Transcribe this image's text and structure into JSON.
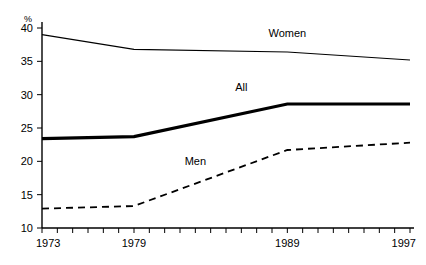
{
  "chart_data": {
    "type": "line",
    "title": "",
    "xlabel": "",
    "ylabel": "%",
    "x": [
      1973,
      1979,
      1989,
      1997
    ],
    "xlim": [
      1973,
      1997
    ],
    "ylim": [
      10,
      40
    ],
    "yticks": [
      10,
      15,
      20,
      25,
      30,
      35,
      40
    ],
    "xticks_labeled": [
      1973,
      1979,
      1989,
      1997
    ],
    "xticks_minor_step": 1,
    "grid": false,
    "legend": "inline-labels",
    "series": [
      {
        "name": "Women",
        "style": "thin-solid",
        "values": [
          39.0,
          36.8,
          36.4,
          35.2
        ],
        "label_x": 1989,
        "label_y": 38.6
      },
      {
        "name": "All",
        "style": "thick-solid",
        "values": [
          23.4,
          23.7,
          28.6,
          28.6
        ],
        "label_x": 1986,
        "label_y": 30.6
      },
      {
        "name": "Men",
        "style": "dashed",
        "values": [
          12.9,
          13.3,
          21.7,
          22.8
        ],
        "label_x": 1983,
        "label_y": 19.4
      }
    ]
  },
  "axis": {
    "y_unit": "%",
    "y_tick_labels": [
      "10",
      "15",
      "20",
      "25",
      "30",
      "35",
      "40"
    ],
    "x_tick_labels": [
      "1973",
      "1979",
      "1989",
      "1997"
    ]
  },
  "colors": {
    "line": "#000000",
    "background": "#ffffff"
  }
}
